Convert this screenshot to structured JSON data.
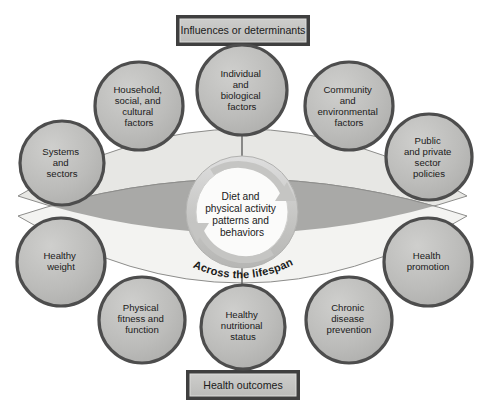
{
  "figure": {
    "title_box_top": "Influences or determinants",
    "title_box_bottom": "Health outcomes",
    "center": {
      "line1": "Diet and",
      "line2": "physical activity",
      "line3": "patterns and",
      "line4": "behaviors"
    },
    "lifespan_caption": "Across the lifespan"
  },
  "influences": [
    {
      "id": "systems-and-sectors",
      "lines": [
        "Systems",
        "and",
        "sectors"
      ]
    },
    {
      "id": "household-social-cultural-factors",
      "lines": [
        "Household,",
        "social, and",
        "cultural",
        "factors"
      ]
    },
    {
      "id": "individual-and-biological-factors",
      "lines": [
        "Individual",
        "and",
        "biological",
        "factors"
      ]
    },
    {
      "id": "community-and-environmental-factors",
      "lines": [
        "Community",
        "and",
        "environmental",
        "factors"
      ]
    },
    {
      "id": "public-and-private-sector-policies",
      "lines": [
        "Public",
        "and private",
        "sector",
        "policies"
      ]
    }
  ],
  "outcomes": [
    {
      "id": "healthy-weight",
      "lines": [
        "Healthy",
        "weight"
      ]
    },
    {
      "id": "physical-fitness-and-function",
      "lines": [
        "Physical",
        "fitness and",
        "function"
      ]
    },
    {
      "id": "healthy-nutritional-status",
      "lines": [
        "Healthy",
        "nutritional",
        "status"
      ]
    },
    {
      "id": "chronic-disease-prevention",
      "lines": [
        "Chronic",
        "disease",
        "prevention"
      ]
    },
    {
      "id": "health-promotion",
      "lines": [
        "Health",
        "promotion"
      ]
    }
  ],
  "colors": {
    "circle_fill": "#b9b9b7",
    "circle_stroke": "#4d4d4d",
    "box_fill": "#c2c2c0",
    "box_stroke": "#3f3f3f",
    "box_inner": "#d8d8d6",
    "lens_top_fill": "#e7e7e4",
    "lens_bottom_fill": "#f2f2f0",
    "lens_overlap_fill": "#a9a9a7",
    "lens_stroke": "#8f8f8d",
    "center_disc": "#fbfbfa",
    "center_ring": "#c9c9c7",
    "connector": "#555555",
    "text": "#1a1a1a"
  }
}
